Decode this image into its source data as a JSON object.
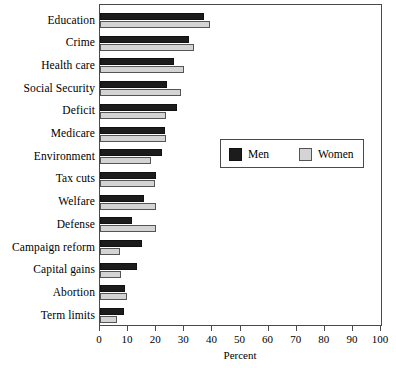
{
  "chart_data": {
    "type": "bar",
    "orientation": "horizontal",
    "title": "",
    "xlabel": "Percent",
    "ylabel": "",
    "xlim": [
      0,
      100
    ],
    "xticks": [
      0,
      10,
      20,
      30,
      40,
      50,
      60,
      70,
      80,
      90,
      100
    ],
    "grid": false,
    "legend_position": "center-right",
    "categories": [
      "Education",
      "Crime",
      "Health care",
      "Social Security",
      "Deficit",
      "Medicare",
      "Environment",
      "Tax cuts",
      "Welfare",
      "Defense",
      "Campaign reform",
      "Capital gains",
      "Abortion",
      "Term limits"
    ],
    "series": [
      {
        "name": "Men",
        "color": "#1c1c1c",
        "values": [
          37,
          31.5,
          26.5,
          24,
          27.5,
          23,
          22,
          20,
          15.5,
          11.5,
          15,
          13,
          9,
          8.5
        ]
      },
      {
        "name": "Women",
        "color": "#d4d4d4",
        "values": [
          39,
          33.5,
          30,
          29,
          23.5,
          23.5,
          18,
          19.5,
          20,
          20,
          7,
          7.5,
          9.5,
          6
        ]
      }
    ]
  },
  "legend": {
    "entries": [
      {
        "label": "Men"
      },
      {
        "label": "Women"
      }
    ]
  }
}
